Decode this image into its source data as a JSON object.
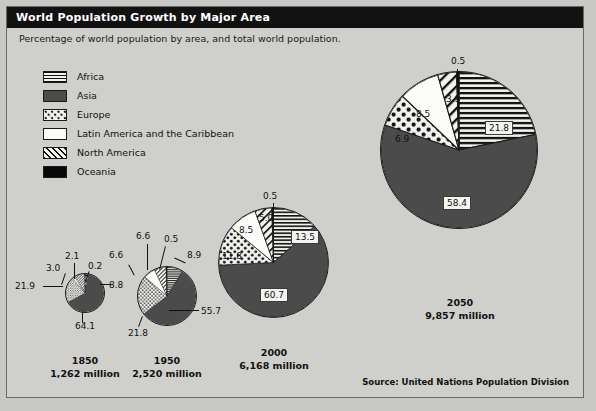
{
  "window": {
    "title": "World Population Growth by Major Area",
    "subtitle": "Percentage of world population by area, and total world population."
  },
  "legend": {
    "items": [
      {
        "label": "Africa",
        "pattern": "horizontal-lines",
        "color": "#111111"
      },
      {
        "label": "Asia",
        "pattern": "solid-dark-gray",
        "color": "#4b4b4b"
      },
      {
        "label": "Europe",
        "pattern": "dots",
        "color": "#111111"
      },
      {
        "label": "Latin America and the Caribbean",
        "pattern": "white",
        "color": "#fbfbf8"
      },
      {
        "label": "North America",
        "pattern": "diagonal-lines",
        "color": "#111111"
      },
      {
        "label": "Oceania",
        "pattern": "solid-black",
        "color": "#080808"
      }
    ]
  },
  "source": "Source: United Nations Population Division",
  "chart_data": {
    "type": "pie",
    "title": "World Population Growth by Major Area",
    "subtitle": "Percentage of world population by area, and total world population.",
    "categories": [
      "Africa",
      "Asia",
      "Europe",
      "Latin America and the Caribbean",
      "North America",
      "Oceania"
    ],
    "unit": "percent of world population",
    "pies": [
      {
        "year": "1850",
        "total": "1,262 million",
        "values": [
          3.0,
          64.1,
          21.9,
          2.1,
          8.8,
          0.2
        ],
        "labels": [
          "3.0",
          "64.1",
          "21.9",
          "2.1",
          "8.8",
          "0.2"
        ]
      },
      {
        "year": "1950",
        "total": "2,520 million",
        "values": [
          8.9,
          55.7,
          21.8,
          6.6,
          6.6,
          0.5
        ],
        "labels": [
          "8.9",
          "55.7",
          "21.8",
          "6.6",
          "6.6",
          "0.5"
        ]
      },
      {
        "year": "2000",
        "total": "6,168 million",
        "values": [
          13.5,
          60.7,
          11.8,
          8.5,
          5.0,
          0.5
        ],
        "labels": [
          "13.5",
          "60.7",
          "11.8",
          "8.5",
          "5.0",
          "0.5"
        ]
      },
      {
        "year": "2050",
        "total": "9,857 million",
        "values": [
          21.8,
          58.4,
          6.9,
          8.5,
          3.9,
          0.5
        ],
        "labels": [
          "21.8",
          "58.4",
          "6.9",
          "8.5",
          "3.9",
          "0.5"
        ]
      }
    ]
  }
}
